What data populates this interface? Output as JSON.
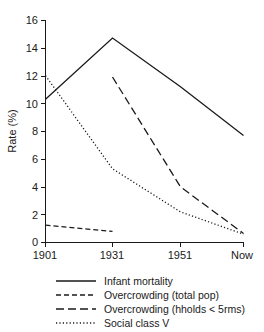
{
  "chart_data": {
    "type": "line",
    "title": "",
    "xlabel": "",
    "ylabel": "Rate (%)",
    "x_categories": [
      "1901",
      "1931",
      "1951",
      "Now"
    ],
    "y_ticks": [
      0,
      2,
      4,
      6,
      8,
      10,
      12,
      14,
      16
    ],
    "ylim": [
      0,
      16
    ],
    "grid": false,
    "legend_position": "below-axes",
    "series": [
      {
        "name": "Infant mortality",
        "style": "solid",
        "x": [
          "1901",
          "1931",
          "1951",
          "Now"
        ],
        "values": [
          10.3,
          14.7,
          11.2,
          7.7
        ]
      },
      {
        "name": "Overcrowding (total pop)",
        "style": "dashed-short",
        "x": [
          "1901",
          "1931"
        ],
        "values": [
          1.25,
          0.8
        ]
      },
      {
        "name": "Overcrowding (hholds < 5rms)",
        "style": "dashed-long",
        "x": [
          "1931",
          "1951",
          "Now"
        ],
        "values": [
          11.9,
          4.0,
          0.65
        ]
      },
      {
        "name": "Social class V",
        "style": "dotted",
        "x": [
          "1901",
          "1931",
          "1951",
          "Now"
        ],
        "values": [
          12.0,
          5.3,
          2.2,
          0.6
        ]
      }
    ]
  },
  "axes": {
    "y_title": "Rate (%)",
    "y_tick_labels": [
      "0",
      "2",
      "4",
      "6",
      "8",
      "10",
      "12",
      "14",
      "16"
    ],
    "x_tick_labels": [
      "1901",
      "1931",
      "1951",
      "Now"
    ]
  },
  "legend": {
    "entries": [
      {
        "label": "Infant mortality",
        "style": "solid"
      },
      {
        "label": "Overcrowding (total pop)",
        "style": "dashed-short"
      },
      {
        "label": "Overcrowding (hholds < 5rms)",
        "style": "dashed-long"
      },
      {
        "label": "Social class V",
        "style": "dotted"
      }
    ]
  }
}
